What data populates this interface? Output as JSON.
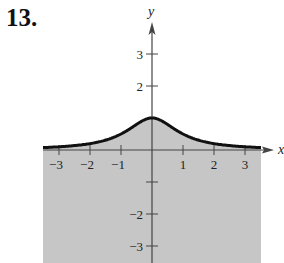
{
  "problem": {
    "number": "13."
  },
  "chart_data": {
    "type": "line",
    "title": "",
    "function": "y = 1/(x^2+1)",
    "xlabel": "x",
    "ylabel": "y",
    "xlim": [
      -3.5,
      3.5
    ],
    "ylim": [
      -3.5,
      3.8
    ],
    "x_ticks": [
      -3,
      -2,
      -1,
      1,
      2,
      3
    ],
    "x_tick_labels": [
      "−3",
      "−2",
      "−1",
      "1",
      "2",
      "3"
    ],
    "y_ticks": [
      3,
      2,
      -1,
      -2,
      -3
    ],
    "y_tick_labels": [
      "3",
      "2",
      "",
      "−2",
      "−3"
    ],
    "series": [
      {
        "name": "curve",
        "x": [
          -3.5,
          -3,
          -2.5,
          -2,
          -1.5,
          -1,
          -0.5,
          0,
          0.5,
          1,
          1.5,
          2,
          2.5,
          3,
          3.5
        ],
        "values": [
          0.08,
          0.1,
          0.14,
          0.2,
          0.31,
          0.5,
          0.8,
          1.0,
          0.8,
          0.5,
          0.31,
          0.2,
          0.14,
          0.1,
          0.08
        ]
      }
    ],
    "shaded_region": "below curve, over x in [-3.5, 3.5]",
    "grid": false,
    "legend": "none",
    "colors": {
      "shade": "#c6c6c6",
      "curve": "#111111",
      "axis": "#444444"
    }
  }
}
